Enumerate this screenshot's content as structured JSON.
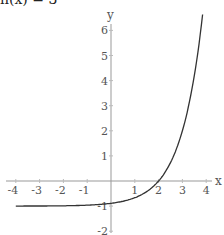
{
  "title": "h(x) = 3",
  "title_suffix": "·",
  "chart_data": {
    "type": "line",
    "xlabel": "x",
    "ylabel": "y",
    "xlim": [
      -4,
      4
    ],
    "ylim": [
      -2,
      6
    ],
    "x_ticks": [
      -4,
      -3,
      -2,
      -1,
      1,
      2,
      3,
      4
    ],
    "y_ticks": [
      -2,
      -1,
      1,
      2,
      3,
      4,
      5,
      6
    ],
    "grid": false,
    "legend": null,
    "series": [
      {
        "name": "h(x)",
        "x": [
          -4,
          -3,
          -2,
          -1,
          0,
          1,
          2,
          3,
          3.5,
          3.85
        ],
        "y": [
          -0.999,
          -0.996,
          -0.988,
          -0.963,
          -0.889,
          -0.667,
          0,
          2,
          4.2,
          6.0
        ]
      }
    ],
    "asymptote": -1
  },
  "axes": {
    "x_label": "x",
    "y_label": "y",
    "x_tick_labels": [
      "-4",
      "-3",
      "-2",
      "-1",
      "1",
      "2",
      "3",
      "4"
    ],
    "y_tick_labels": [
      "6",
      "5",
      "4",
      "3",
      "2",
      "1",
      "-1",
      "-2"
    ]
  }
}
